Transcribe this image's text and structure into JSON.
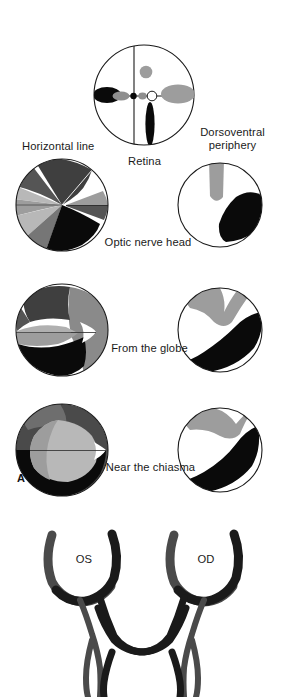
{
  "figure": {
    "panels": [
      {
        "id": "A",
        "letter": "A",
        "x": 18,
        "y": 470
      }
    ],
    "labels": {
      "retina": "Retina",
      "horizontal_line": "Horizontal line",
      "dorsoventral_periphery_line1": "Dorsoventral",
      "dorsoventral_periphery_line2": "periphery",
      "optic_nerve_head": "Optic nerve head",
      "from_the_globe": "From the globe",
      "near_the_chiasma": "Near the chiasma",
      "os": "OS",
      "od": "OD"
    },
    "colors": {
      "outline": "#1a1a1a",
      "black": "#0a0a0a",
      "dark_gray": "#3f3f3f",
      "mid_dark_gray": "#555555",
      "mid_gray": "#767676",
      "light_gray": "#9d9d9d",
      "pale_gray": "#b8b8b8",
      "very_pale_gray": "#d0d0d0",
      "white": "#ffffff",
      "text": "#1a1a1a",
      "background": "#ffffff"
    },
    "retina_diagram": {
      "caption": "Retina",
      "center": {
        "x": 144,
        "y": 95
      },
      "radius": 50,
      "axes": {
        "horizontal": true,
        "vertical": true
      },
      "features": [
        {
          "name": "fovea-ring",
          "shade": "white-ring",
          "cx": 150,
          "cy": 96
        },
        {
          "name": "optic-disc-dot",
          "shade": "black",
          "cx": 134,
          "cy": 96
        },
        {
          "name": "temporal-black-blob",
          "shade": "black",
          "cx": 107,
          "cy": 95
        },
        {
          "name": "papillomacular-gray-blob",
          "shade": "mid_gray",
          "cx": 120,
          "cy": 96
        },
        {
          "name": "nasal-light-gray-blob",
          "shade": "light_gray",
          "cx": 178,
          "cy": 94
        },
        {
          "name": "dorsal-gray-circle",
          "shade": "light_gray",
          "cx": 146,
          "cy": 72
        },
        {
          "name": "ventral-black-ellipse",
          "shade": "black",
          "cx": 150,
          "cy": 123
        }
      ]
    },
    "rows": [
      {
        "id": "optic-nerve-head",
        "caption": "Optic nerve head",
        "left_disc": {
          "cx": 62,
          "cy": 205,
          "r": 46,
          "label": "Horizontal line"
        },
        "right_disc": {
          "cx": 220,
          "cy": 205,
          "r": 42,
          "label": "Dorsoventral periphery"
        }
      },
      {
        "id": "from-the-globe",
        "caption": "From the globe",
        "left_disc": {
          "cx": 62,
          "cy": 330,
          "r": 46
        },
        "right_disc": {
          "cx": 220,
          "cy": 330,
          "r": 42
        }
      },
      {
        "id": "near-the-chiasma",
        "caption": "Near the chiasma",
        "left_disc": {
          "cx": 62,
          "cy": 450,
          "r": 46
        },
        "right_disc": {
          "cx": 220,
          "cy": 450,
          "r": 42
        }
      }
    ],
    "chiasm_diagram": {
      "left_eye_label": "OS",
      "right_eye_label": "OD",
      "left_eye_center": {
        "x": 84,
        "y": 560
      },
      "right_eye_center": {
        "x": 205,
        "y": 560
      }
    }
  }
}
